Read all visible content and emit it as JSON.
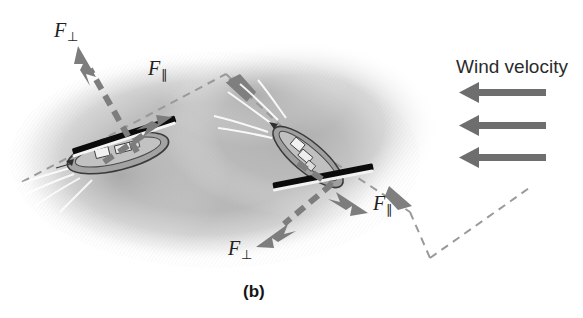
{
  "figure": {
    "panel_label": "(b)",
    "panel_label_pos": [
      243,
      283
    ],
    "background_color": "#ffffff",
    "water_color": "#b9b9b9",
    "vector_color": "#7d7d7d",
    "wind_arrow_color": "#6e6e6e",
    "sail_color": "#0b0b0b",
    "path_color": "#9a9a9a",
    "text_color": "#231f20"
  },
  "wind": {
    "label": "Wind velocity",
    "label_pos": [
      456,
      57
    ],
    "direction": "leftward",
    "arrow_count": 3,
    "arrows": [
      {
        "name": "wind-arrow-1",
        "x_tail": 546,
        "x_head": 459,
        "y": 93
      },
      {
        "name": "wind-arrow-2",
        "x_tail": 546,
        "x_head": 459,
        "y": 126
      },
      {
        "name": "wind-arrow-3",
        "x_tail": 546,
        "x_head": 459,
        "y": 158
      }
    ]
  },
  "boats": [
    {
      "name": "boat-left",
      "hull_center": [
        118,
        152
      ],
      "sail_angle_deg": -18,
      "forces": [
        {
          "name": "force-perpendicular",
          "symbol": "F",
          "subscript": "⊥",
          "label_pos": [
            54,
            20
          ],
          "tail": [
            137,
            152
          ],
          "head": [
            78,
            48
          ],
          "style": "dashed"
        },
        {
          "name": "force-parallel",
          "symbol": "F",
          "subscript": "∥",
          "label_pos": [
            148,
            58
          ],
          "tail": [
            110,
            158
          ],
          "head": [
            170,
            118
          ],
          "style": "dashed"
        }
      ]
    },
    {
      "name": "boat-right",
      "hull_center": [
        307,
        158
      ],
      "sail_angle_deg": -14,
      "forces": [
        {
          "name": "force-perpendicular",
          "symbol": "F",
          "subscript": "⊥",
          "label_pos": [
            228,
            238
          ],
          "tail": [
            330,
            186
          ],
          "head": [
            258,
            246
          ],
          "style": "dashed"
        },
        {
          "name": "force-parallel",
          "symbol": "F",
          "subscript": "∥",
          "label_pos": [
            373,
            193
          ],
          "tail": [
            300,
            166
          ],
          "head": [
            368,
            213
          ],
          "style": "dashed"
        }
      ]
    }
  ],
  "tacking_path": {
    "name": "tacking-path",
    "style": "dashed",
    "points": [
      [
        22,
        182
      ],
      [
        226,
        74
      ],
      [
        280,
        126
      ],
      [
        410,
        212
      ],
      [
        430,
        258
      ],
      [
        530,
        188
      ]
    ],
    "arrowheads": [
      {
        "name": "path-arrowhead-upper",
        "at": [
          236,
          88
        ],
        "angle_deg": 133
      },
      {
        "name": "path-arrowhead-lower",
        "at": [
          403,
          200
        ],
        "angle_deg": 37
      }
    ]
  }
}
